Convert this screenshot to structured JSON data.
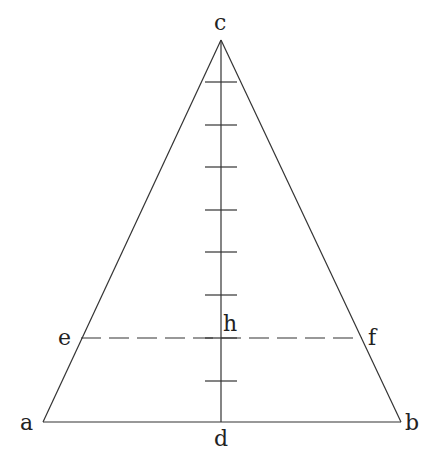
{
  "diagram": {
    "type": "isosceles-triangle-with-altitude",
    "stroke_color": "#333333",
    "background": "#ffffff",
    "points": {
      "a": {
        "label": "a",
        "x": 43,
        "y": 422
      },
      "b": {
        "label": "b",
        "x": 401,
        "y": 422
      },
      "c": {
        "label": "c",
        "x": 221,
        "y": 40
      },
      "d": {
        "label": "d",
        "x": 221,
        "y": 422
      },
      "e": {
        "label": "e",
        "x": 81,
        "y": 338
      },
      "f": {
        "label": "f",
        "x": 362,
        "y": 338
      },
      "h": {
        "label": "h",
        "x": 221,
        "y": 338
      }
    },
    "altitude_ticks_y": [
      82,
      125,
      167,
      210,
      252,
      295,
      338,
      381
    ],
    "tick_count": 8,
    "dashed_segment": "ef"
  }
}
